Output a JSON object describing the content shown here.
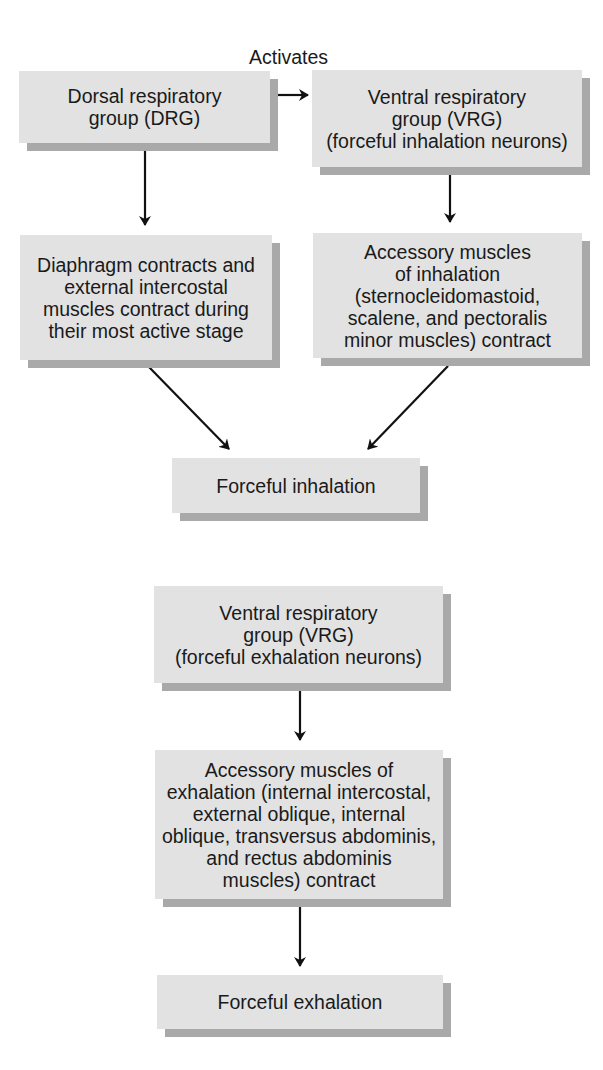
{
  "diagram": {
    "edge_label": "Activates",
    "colors": {
      "box_fill": "#e2e2e2",
      "box_shadow": "#a9a9a9",
      "arrow": "#111111",
      "text": "#1a1a1a"
    },
    "inhalation": {
      "drg": {
        "lines": [
          "Dorsal respiratory",
          "group (DRG)"
        ]
      },
      "vrg": {
        "lines": [
          "Ventral respiratory",
          "group (VRG)",
          "(forceful inhalation neurons)"
        ]
      },
      "diaphragm": {
        "lines": [
          "Diaphragm contracts and",
          "external intercostal",
          "muscles contract during",
          "their most active stage"
        ]
      },
      "accessory": {
        "lines": [
          "Accessory muscles",
          "of inhalation",
          "(sternocleidomastoid,",
          "scalene, and pectoralis",
          "minor muscles) contract"
        ]
      },
      "result": {
        "lines": [
          "Forceful inhalation"
        ]
      }
    },
    "exhalation": {
      "vrg": {
        "lines": [
          "Ventral respiratory",
          "group (VRG)",
          "(forceful exhalation neurons)"
        ]
      },
      "accessory": {
        "lines": [
          "Accessory muscles of",
          "exhalation (internal intercostal,",
          "external oblique, internal",
          "oblique, transversus abdominis,",
          "and rectus abdominis",
          "muscles) contract"
        ]
      },
      "result": {
        "lines": [
          "Forceful exhalation"
        ]
      }
    },
    "edges": [
      {
        "from": "drg",
        "to": "vrg_inhalation",
        "label": "Activates"
      },
      {
        "from": "drg",
        "to": "diaphragm"
      },
      {
        "from": "vrg_inhalation",
        "to": "accessory_inhalation"
      },
      {
        "from": "diaphragm",
        "to": "forceful_inhalation"
      },
      {
        "from": "accessory_inhalation",
        "to": "forceful_inhalation"
      },
      {
        "from": "vrg_exhalation",
        "to": "accessory_exhalation"
      },
      {
        "from": "accessory_exhalation",
        "to": "forceful_exhalation"
      }
    ]
  }
}
